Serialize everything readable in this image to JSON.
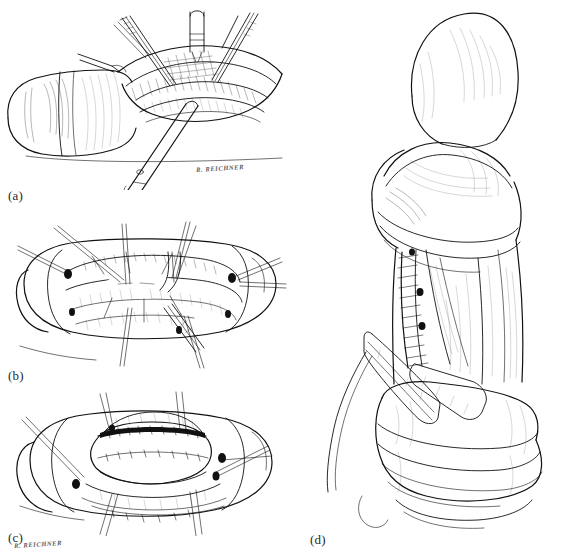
{
  "figure": {
    "type": "surgical-technique-illustration-plate",
    "medium": "black-and-white pen-and-ink line drawing",
    "background_color": "#ffffff",
    "ink_color": "#111111",
    "panel_count": 4,
    "layout": "three stacked panels in the left column (a, b, c) and one large panel (d) in the right column",
    "caption": "Figure caption text is cropped off at the bottom edge of the image and is not legible."
  },
  "panels": [
    {
      "id": "a",
      "label": "(a)",
      "position": "top-left",
      "description": "Operative field shown from the side: a tubular organ lying horizontally to the left with an open surgical incision to the right, held open by retractors, with forceps and a long clamp entering the field from above and below.",
      "signature": "R. REICHNER",
      "signature_present": true
    },
    {
      "id": "b",
      "label": "(b)",
      "position": "middle-left",
      "description": "Close-up, end-on view of the open wound showing a ring of tissue flaps with an oval opening at the centre; multiple straight traction sutures radiate outward and an instrument is passed through the opening.",
      "signature": "R. REICHNER",
      "signature_present": true
    },
    {
      "id": "c",
      "label": "(c)",
      "position": "bottom-left",
      "description": "Same end-on view after the flaps have been advanced and sutured: the central defect is closed into a polygonal outline with running suture lines and traction sutures still in place.",
      "signature": "R. REICHNER",
      "signature_present": true
    },
    {
      "id": "d",
      "label": "(d)",
      "position": "right column, full height",
      "description": "Final postoperative result in an upright, enlarged view: the shaft and rounded distal end with a redundant cuff of overlying tissue, a long vertical interrupted suture line down the left side, a drain or splint taped across the lower shaft, and a thick encircling dressing roll at the base.",
      "signature": "RBR",
      "signature_present": true
    }
  ],
  "labels": {
    "a": "(a)",
    "b": "(b)",
    "c": "(c)",
    "d": "(d)"
  },
  "signatures": {
    "reichner": "R. REICHNER",
    "monogram": "RBR"
  },
  "caption_text": ""
}
